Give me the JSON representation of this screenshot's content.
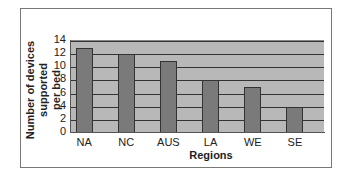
{
  "chart_data": {
    "type": "bar",
    "title": "",
    "xlabel": "Regions",
    "ylabel": "Number of devices supported per bed",
    "ylabel_line1": "Number of devices supported",
    "ylabel_line2": "per bed",
    "categories": [
      "NA",
      "NC",
      "AUS",
      "LA",
      "WE",
      "SE"
    ],
    "values": [
      13,
      12,
      11,
      8,
      7,
      4
    ],
    "ylim": [
      0,
      14
    ],
    "yticks": [
      "14",
      "12",
      "10",
      "8",
      "6",
      "4",
      "2",
      "0"
    ],
    "grid": true,
    "legend": null,
    "colors": {
      "plot_bg": "#b8b8b8",
      "bar": "#7a7a7a",
      "gridline": "#333333"
    }
  }
}
